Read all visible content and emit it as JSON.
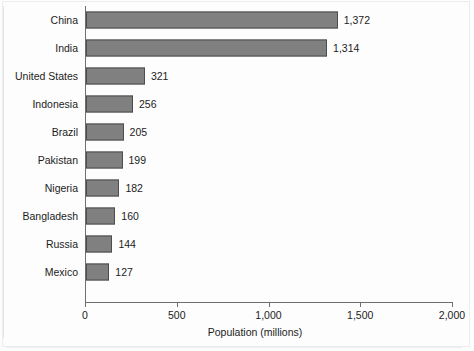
{
  "chart_data": {
    "type": "bar",
    "orientation": "horizontal",
    "title": "",
    "xlabel": "Population (millions)",
    "ylabel": "",
    "xlim": [
      0,
      2000
    ],
    "xticks": [
      "0",
      "500",
      "1,000",
      "1,500",
      "2,000"
    ],
    "xtick_values": [
      0,
      500,
      1000,
      1500,
      2000
    ],
    "grid": false,
    "legend": null,
    "categories": [
      "China",
      "India",
      "United States",
      "Indonesia",
      "Brazil",
      "Pakistan",
      "Nigeria",
      "Bangladesh",
      "Russia",
      "Mexico"
    ],
    "values": [
      1372,
      1314,
      321,
      256,
      205,
      199,
      182,
      160,
      144,
      127
    ],
    "value_labels": [
      "1,372",
      "1,314",
      "321",
      "256",
      "205",
      "199",
      "182",
      "160",
      "144",
      "127"
    ],
    "bar_color": "#808080",
    "bar_edge_color": "#4d4d4d",
    "axis_color": "#6e6e6e",
    "text_color": "#1c1c1c",
    "background_color": "#ffffff"
  }
}
